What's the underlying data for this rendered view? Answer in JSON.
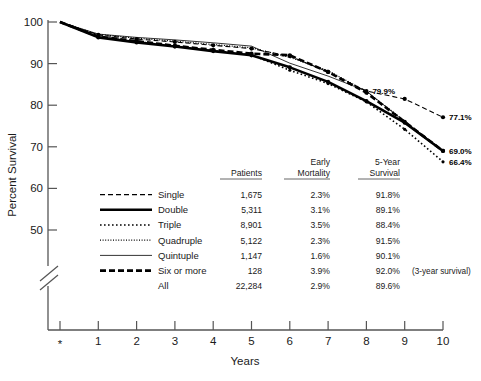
{
  "chart_data": {
    "type": "line",
    "title": "",
    "xlabel": "Years",
    "ylabel": "Percent Survival",
    "xlim": [
      0,
      10
    ],
    "ylim": [
      45,
      100
    ],
    "grid": false,
    "legend_position": "inside-lower-left",
    "x_tick_labels": [
      "*",
      "1",
      "2",
      "3",
      "4",
      "5",
      "6",
      "7",
      "8",
      "9",
      "10"
    ],
    "y_tick_labels": [
      "50",
      "60",
      "70",
      "80",
      "90",
      "100"
    ],
    "y_axis_break": true,
    "x": [
      0,
      1,
      2,
      3,
      4,
      5,
      6,
      7,
      8,
      9,
      10
    ],
    "series": [
      {
        "name": "Single",
        "style": "dashed",
        "values": [
          100,
          96.9,
          95.9,
          95.2,
          94.4,
          93.6,
          91.8,
          88.0,
          83.4,
          81.5,
          77.1
        ],
        "end_label": "77.1%"
      },
      {
        "name": "Double",
        "style": "thick-solid",
        "values": [
          100,
          96.3,
          95.1,
          94.1,
          93.0,
          92.0,
          89.1,
          85.6,
          81.0,
          75.8,
          69.0
        ],
        "end_label": "69.0%"
      },
      {
        "name": "Triple",
        "style": "dotted",
        "values": [
          100,
          96.5,
          95.3,
          94.2,
          93.1,
          92.1,
          88.4,
          85.2,
          80.8,
          74.2,
          66.4
        ],
        "end_label": "66.4%"
      },
      {
        "name": "Quadruple",
        "style": "fine-dotted",
        "values": [
          100,
          97.0,
          96.1,
          95.4,
          94.6,
          93.8,
          91.5,
          88.3,
          83.3,
          76.2,
          69.0
        ],
        "end_label": ""
      },
      {
        "name": "Quintuple",
        "style": "thin-solid",
        "values": [
          100,
          97.1,
          96.3,
          95.7,
          95.0,
          94.2,
          90.1,
          87.0,
          83.4,
          76.0,
          69.0
        ],
        "end_label": ""
      },
      {
        "name": "Six or more",
        "style": "thick-dashed",
        "values": [
          100,
          96.5,
          95.4,
          94.3,
          93.3,
          92.4,
          92.0,
          88.0,
          83.0,
          76.0,
          69.0
        ],
        "end_label": ""
      }
    ],
    "annotations": [
      {
        "text": "79.9%",
        "x": 8,
        "y": 83.4
      },
      {
        "text": "77.1%",
        "x": 10,
        "y": 77.1
      },
      {
        "text": "69.0%",
        "x": 10,
        "y": 69.0
      },
      {
        "text": "66.4%",
        "x": 10,
        "y": 66.4
      }
    ]
  },
  "axes": {
    "y_title": "Percent Survival",
    "x_title": "Years",
    "y_ticks": [
      {
        "label": "100",
        "value": 100
      },
      {
        "label": "90",
        "value": 90
      },
      {
        "label": "80",
        "value": 80
      },
      {
        "label": "70",
        "value": 70
      },
      {
        "label": "60",
        "value": 60
      },
      {
        "label": "50",
        "value": 50
      }
    ],
    "x_ticks": [
      {
        "label": "*",
        "value": 0
      },
      {
        "label": "1",
        "value": 1
      },
      {
        "label": "2",
        "value": 2
      },
      {
        "label": "3",
        "value": 3
      },
      {
        "label": "4",
        "value": 4
      },
      {
        "label": "5",
        "value": 5
      },
      {
        "label": "6",
        "value": 6
      },
      {
        "label": "7",
        "value": 7
      },
      {
        "label": "8",
        "value": 8
      },
      {
        "label": "9",
        "value": 9
      },
      {
        "label": "10",
        "value": 10
      }
    ]
  },
  "legend_table": {
    "columns": [
      "",
      "Patients",
      "Early Mortality",
      "5-Year Survival",
      ""
    ],
    "headers": {
      "patients": "Patients",
      "early_line1": "Early",
      "early_line2": "Mortality",
      "survival_line1": "5-Year",
      "survival_line2": "Survival"
    },
    "rows": [
      {
        "name": "Single",
        "style": "dashed",
        "patients": "1,675",
        "early_mortality": "2.3%",
        "five_year_survival": "91.8%",
        "note": ""
      },
      {
        "name": "Double",
        "style": "thick-solid",
        "patients": "5,311",
        "early_mortality": "3.1%",
        "five_year_survival": "89.1%",
        "note": ""
      },
      {
        "name": "Triple",
        "style": "dotted",
        "patients": "8,901",
        "early_mortality": "3.5%",
        "five_year_survival": "88.4%",
        "note": ""
      },
      {
        "name": "Quadruple",
        "style": "fine-dotted",
        "patients": "5,122",
        "early_mortality": "2.3%",
        "five_year_survival": "91.5%",
        "note": ""
      },
      {
        "name": "Quintuple",
        "style": "thin-solid",
        "patients": "1,147",
        "early_mortality": "1.6%",
        "five_year_survival": "90.1%",
        "note": ""
      },
      {
        "name": "Six or more",
        "style": "thick-dashed",
        "patients": "128",
        "early_mortality": "3.9%",
        "five_year_survival": "92.0%",
        "note": "(3-year survival)"
      },
      {
        "name": "All",
        "style": "none",
        "patients": "22,284",
        "early_mortality": "2.9%",
        "five_year_survival": "89.6%",
        "note": ""
      }
    ]
  },
  "colors": {
    "ink": "#1a1a1a",
    "axis": "#555555",
    "background": "#ffffff"
  }
}
